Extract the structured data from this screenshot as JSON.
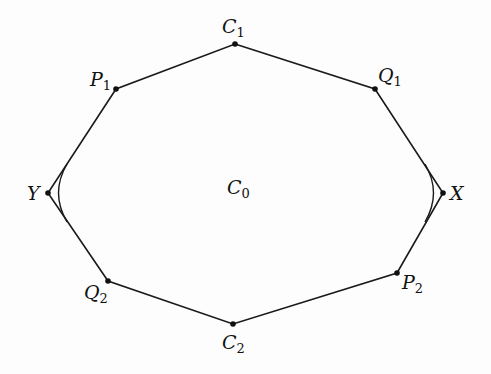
{
  "diagram": {
    "title": "",
    "region_label": {
      "base": "C",
      "sub": "0",
      "x": 227,
      "y": 178
    },
    "points": [
      {
        "id": "C1",
        "base": "C",
        "sub": "1",
        "x": 235,
        "y": 44,
        "lx": 222,
        "ly": 17
      },
      {
        "id": "Q1",
        "base": "Q",
        "sub": "1",
        "x": 375,
        "y": 89,
        "lx": 378,
        "ly": 66
      },
      {
        "id": "X",
        "base": "X",
        "sub": "",
        "x": 443,
        "y": 193,
        "lx": 450,
        "ly": 184
      },
      {
        "id": "P2",
        "base": "P",
        "sub": "2",
        "x": 397,
        "y": 273,
        "lx": 402,
        "ly": 273
      },
      {
        "id": "C2",
        "base": "C",
        "sub": "2",
        "x": 233,
        "y": 324,
        "lx": 222,
        "ly": 333
      },
      {
        "id": "Q2",
        "base": "Q",
        "sub": "2",
        "x": 108,
        "y": 281,
        "lx": 84,
        "ly": 283
      },
      {
        "id": "Y",
        "base": "Y",
        "sub": "",
        "x": 48,
        "y": 193,
        "lx": 27,
        "ly": 184
      },
      {
        "id": "P1",
        "base": "P",
        "sub": "1",
        "x": 116,
        "y": 89,
        "lx": 90,
        "ly": 70
      }
    ],
    "polygon_order": [
      "C1",
      "Q1",
      "X",
      "P2",
      "C2",
      "Q2",
      "Y",
      "P1"
    ],
    "arcs": [
      {
        "name": "left-arc",
        "path": "M 67 164 Q 50 193 67 222"
      },
      {
        "name": "right-arc",
        "path": "M 425 164 Q 442 193 425 222"
      }
    ],
    "colors": {
      "stroke": "#1a1a1a",
      "background": "#fdfdfd"
    }
  }
}
